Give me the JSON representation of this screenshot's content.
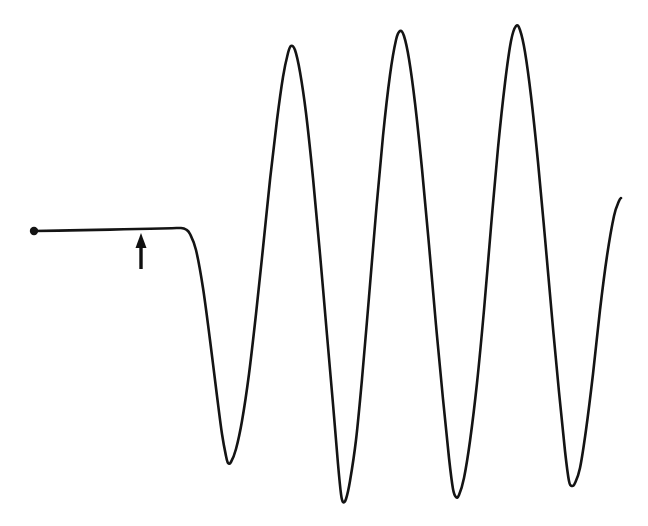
{
  "figure": {
    "title": "",
    "background_color": "#ffffff",
    "width": 648,
    "height": 526,
    "trace_color": "#141414",
    "trace_width": 2.6,
    "marker_color": "#141414",
    "arrow_color": "#101010"
  },
  "annotations": {
    "onset_arrow": {
      "name": "onset-arrow",
      "label": "",
      "tip_x": 141,
      "tip_y": 233,
      "tail_x": 141,
      "tail_y": 269,
      "head_width": 11,
      "head_height": 15,
      "shaft_width": 3.4
    },
    "start_marker": {
      "name": "start-dot",
      "cx": 34,
      "cy": 231,
      "r": 4.2
    }
  },
  "chart_data": {
    "type": "line",
    "title": "",
    "subtitle": "",
    "xlabel": "",
    "ylabel": "",
    "xlim": [
      0,
      648
    ],
    "ylim": [
      526,
      0
    ],
    "grid": false,
    "legend": null,
    "axes_visible": false,
    "tick_labels_x": [],
    "tick_labels_y": [],
    "baseline_level_y": 230,
    "onset_x": 185,
    "series": [
      {
        "name": "oscillation-trace",
        "color": "#141414",
        "points": [
          [
            34,
            231
          ],
          [
            70,
            230.4
          ],
          [
            110,
            229.6
          ],
          [
            150,
            228.8
          ],
          [
            172,
            228.2
          ],
          [
            181,
            228.0
          ],
          [
            186,
            229.5
          ],
          [
            190,
            234
          ],
          [
            196,
            250
          ],
          [
            203,
            288
          ],
          [
            210,
            340
          ],
          [
            217,
            396
          ],
          [
            222,
            434
          ],
          [
            226,
            456
          ],
          [
            228,
            463
          ],
          [
            231,
            462
          ],
          [
            236,
            449
          ],
          [
            242,
            421
          ],
          [
            249,
            374
          ],
          [
            256,
            314
          ],
          [
            263,
            248
          ],
          [
            270,
            180
          ],
          [
            277,
            120
          ],
          [
            283,
            77
          ],
          [
            288,
            53
          ],
          [
            291,
            46
          ],
          [
            295,
            50
          ],
          [
            300,
            72
          ],
          [
            306,
            113
          ],
          [
            313,
            178
          ],
          [
            320,
            254
          ],
          [
            327,
            335
          ],
          [
            333,
            404
          ],
          [
            338,
            464
          ],
          [
            341,
            494
          ],
          [
            343,
            502
          ],
          [
            346,
            499
          ],
          [
            350,
            481
          ],
          [
            356,
            440
          ],
          [
            362,
            379
          ],
          [
            369,
            297
          ],
          [
            376,
            213
          ],
          [
            383,
            136
          ],
          [
            390,
            75
          ],
          [
            396,
            40
          ],
          [
            400,
            31
          ],
          [
            404,
            36
          ],
          [
            409,
            59
          ],
          [
            415,
            103
          ],
          [
            422,
            169
          ],
          [
            429,
            245
          ],
          [
            436,
            325
          ],
          [
            443,
            399
          ],
          [
            449,
            458
          ],
          [
            453,
            489
          ],
          [
            456,
            497
          ],
          [
            459,
            495
          ],
          [
            464,
            478
          ],
          [
            470,
            441
          ],
          [
            477,
            383
          ],
          [
            484,
            310
          ],
          [
            491,
            227
          ],
          [
            498,
            148
          ],
          [
            505,
            83
          ],
          [
            511,
            41
          ],
          [
            516,
            26
          ],
          [
            520,
            30
          ],
          [
            525,
            52
          ],
          [
            531,
            96
          ],
          [
            538,
            162
          ],
          [
            545,
            238
          ],
          [
            552,
            317
          ],
          [
            559,
            392
          ],
          [
            565,
            451
          ],
          [
            569,
            481
          ],
          [
            572,
            486
          ],
          [
            575,
            483
          ],
          [
            580,
            468
          ],
          [
            586,
            430
          ],
          [
            593,
            374
          ],
          [
            600,
            310
          ],
          [
            607,
            256
          ],
          [
            614,
            216
          ],
          [
            619,
            201
          ],
          [
            621,
            198
          ]
        ]
      }
    ]
  }
}
